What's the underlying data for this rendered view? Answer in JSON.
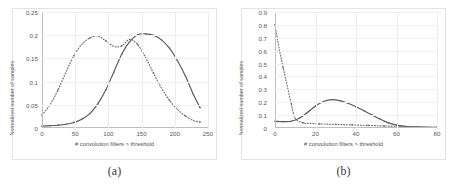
{
  "figure": {
    "panels": [
      {
        "caption": "(a)",
        "chart_data": {
          "type": "line",
          "title": "",
          "xlabel": "# convolution filters > threshold",
          "ylabel": "Normalized number of samples",
          "xlim": [
            0,
            250
          ],
          "ylim": [
            0,
            0.25
          ],
          "xticks": [
            0,
            50,
            100,
            150,
            200,
            250
          ],
          "yticks": [
            "0",
            "0.05",
            "0.1",
            "0.15",
            "0.2",
            "0.25"
          ],
          "grid": true,
          "legend": "none",
          "series": [
            {
              "name": "solid",
              "style": "solid",
              "x": [
                0,
                12,
                24,
                36,
                48,
                60,
                72,
                84,
                96,
                108,
                120,
                132,
                144,
                156,
                168,
                180,
                192,
                204,
                216,
                228,
                238
              ],
              "values": [
                0.004,
                0.005,
                0.006,
                0.008,
                0.012,
                0.019,
                0.031,
                0.052,
                0.082,
                0.12,
                0.159,
                0.186,
                0.201,
                0.203,
                0.2,
                0.19,
                0.172,
                0.145,
                0.112,
                0.072,
                0.044
              ]
            },
            {
              "name": "dotted",
              "style": "dotted",
              "x": [
                0,
                12,
                24,
                36,
                48,
                60,
                72,
                84,
                96,
                108,
                120,
                132,
                144,
                156,
                168,
                180,
                192,
                204,
                216,
                228,
                238
              ],
              "values": [
                0.028,
                0.05,
                0.082,
                0.12,
                0.156,
                0.18,
                0.194,
                0.198,
                0.188,
                0.176,
                0.177,
                0.191,
                0.18,
                0.152,
                0.118,
                0.086,
                0.06,
                0.04,
                0.026,
                0.016,
                0.013
              ]
            }
          ]
        }
      },
      {
        "caption": "(b)",
        "chart_data": {
          "type": "line",
          "title": "",
          "xlabel": "# convolution filters > threshold",
          "ylabel": "Normalized number of samples",
          "xlim": [
            0,
            80
          ],
          "ylim": [
            0,
            0.9
          ],
          "xticks": [
            0,
            20,
            40,
            60,
            80
          ],
          "yticks": [
            "0",
            "0.1",
            "0.2",
            "0.3",
            "0.4",
            "0.5",
            "0.6",
            "0.7",
            "0.8",
            "0.9"
          ],
          "grid": true,
          "legend": "none",
          "series": [
            {
              "name": "solid",
              "style": "solid",
              "x": [
                0,
                4,
                8,
                12,
                16,
                20,
                24,
                28,
                32,
                36,
                40,
                44,
                48,
                52,
                56,
                60,
                64,
                68,
                72,
                76,
                80
              ],
              "values": [
                0.052,
                0.05,
                0.052,
                0.075,
                0.12,
                0.17,
                0.205,
                0.22,
                0.212,
                0.192,
                0.165,
                0.133,
                0.1,
                0.068,
                0.04,
                0.022,
                0.014,
                0.01,
                0.008,
                0.006,
                0.005
              ]
            },
            {
              "name": "dotted",
              "style": "dotted",
              "x": [
                0,
                2,
                4,
                6,
                8,
                10,
                14,
                18,
                22,
                26,
                30,
                34,
                38,
                42,
                46,
                50,
                54,
                58,
                62,
                66,
                70,
                76,
                80
              ],
              "values": [
                0.8,
                0.62,
                0.47,
                0.33,
                0.19,
                0.075,
                0.04,
                0.035,
                0.032,
                0.03,
                0.028,
                0.026,
                0.024,
                0.022,
                0.02,
                0.018,
                0.016,
                0.014,
                0.012,
                0.01,
                0.008,
                0.006,
                0.005
              ]
            }
          ]
        }
      }
    ]
  },
  "colors": {
    "solid_stroke": "#595959",
    "dotted_stroke": "#6e6e6e",
    "frame": "#e3e3e3",
    "grid": "#ededed",
    "axis": "#bdbdbd",
    "text": "#5a5a5a"
  }
}
